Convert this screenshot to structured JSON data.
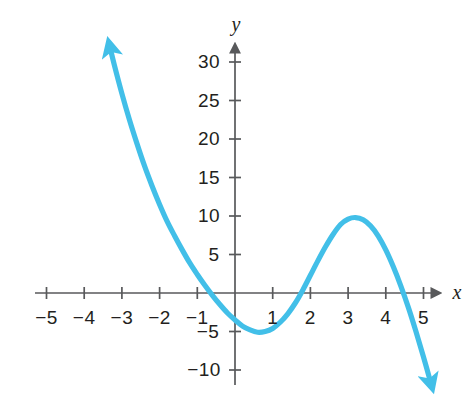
{
  "chart_data": {
    "type": "line",
    "title": "",
    "subtitle": "",
    "xlabel": "x",
    "ylabel": "y",
    "xlim": [
      -5.6,
      5.6
    ],
    "ylim": [
      -12.5,
      32.5
    ],
    "grid": false,
    "legend": null,
    "curve_color": "#42bfe8",
    "axis_color": "#58595b",
    "text_color": "#231f20",
    "x_ticks": [
      -5,
      -4,
      -3,
      -2,
      -1,
      1,
      2,
      3,
      4,
      5
    ],
    "x_tick_labels": [
      "−5",
      "−4",
      "−3",
      "−2",
      "−1",
      "1",
      "2",
      "3",
      "4",
      "5"
    ],
    "y_ticks": [
      -10,
      -5,
      5,
      10,
      15,
      20,
      25,
      30
    ],
    "y_tick_labels": [
      "−10",
      "−5",
      "5",
      "10",
      "15",
      "20",
      "25",
      "30"
    ],
    "function": "y = -(x + 1)(x - 1)(x - 5)",
    "x_intercepts": [
      -1,
      1,
      5
    ],
    "y_intercept": -5,
    "local_minimum": [
      0,
      -3.5
    ],
    "local_maximum": [
      3.5,
      8.4
    ],
    "arrow_start": "up-left",
    "arrow_end": "down-right",
    "series": [
      {
        "name": "cubic",
        "points": [
          [
            -3.32,
            32.0
          ],
          [
            -3.2,
            29.6
          ],
          [
            -3.0,
            25.9
          ],
          [
            -2.8,
            22.5
          ],
          [
            -2.6,
            19.4
          ],
          [
            -2.4,
            16.5
          ],
          [
            -2.2,
            13.9
          ],
          [
            -2.0,
            11.5
          ],
          [
            -1.8,
            9.3
          ],
          [
            -1.6,
            7.4
          ],
          [
            -1.4,
            5.6
          ],
          [
            -1.2,
            3.9
          ],
          [
            -1.0,
            2.4
          ],
          [
            -0.8,
            1.0
          ],
          [
            -0.6,
            -0.3
          ],
          [
            -0.4,
            -1.5
          ],
          [
            -0.2,
            -2.6
          ],
          [
            0.0,
            -3.5
          ],
          [
            0.2,
            -4.3
          ],
          [
            0.4,
            -4.8
          ],
          [
            0.6,
            -5.1
          ],
          [
            0.8,
            -5.0
          ],
          [
            1.0,
            -4.6
          ],
          [
            1.2,
            -3.8
          ],
          [
            1.4,
            -2.7
          ],
          [
            1.6,
            -1.3
          ],
          [
            1.8,
            0.4
          ],
          [
            2.0,
            2.3
          ],
          [
            2.2,
            4.2
          ],
          [
            2.4,
            6.0
          ],
          [
            2.6,
            7.6
          ],
          [
            2.8,
            8.9
          ],
          [
            3.0,
            9.6
          ],
          [
            3.2,
            9.8
          ],
          [
            3.4,
            9.5
          ],
          [
            3.6,
            8.7
          ],
          [
            3.8,
            7.4
          ],
          [
            4.0,
            5.6
          ],
          [
            4.2,
            3.4
          ],
          [
            4.4,
            0.9
          ],
          [
            4.6,
            -1.9
          ],
          [
            4.8,
            -5.0
          ],
          [
            5.0,
            -8.3
          ],
          [
            5.2,
            -11.8
          ]
        ]
      }
    ]
  },
  "geometry": {
    "origin_x": 235,
    "origin_y": 293,
    "x_unit_px": 37.7,
    "y_unit_px": 7.7
  }
}
